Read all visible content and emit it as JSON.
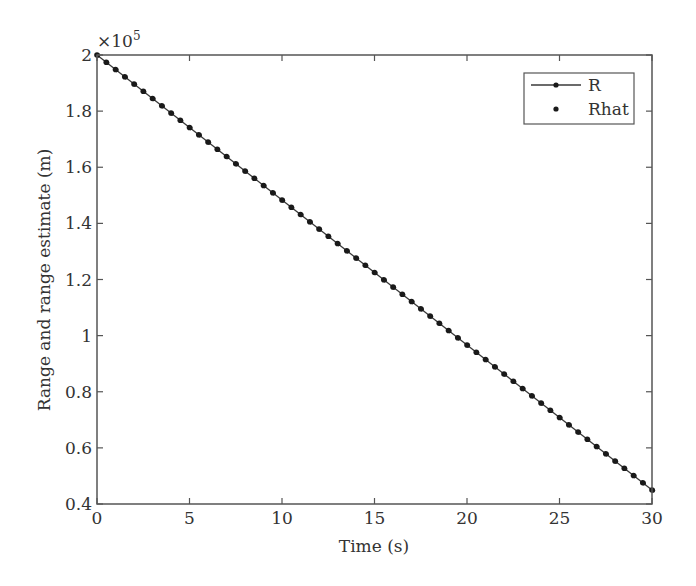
{
  "chart_data": {
    "type": "line",
    "title": "",
    "xlabel": "Time (s)",
    "ylabel": "Range and range estimate (m)",
    "y_multiplier": "×10",
    "y_multiplier_exp": "5",
    "xlim": [
      0,
      30
    ],
    "ylim": [
      0.4,
      2.0
    ],
    "xticks": [
      "0",
      "5",
      "10",
      "15",
      "20",
      "25",
      "30"
    ],
    "yticks": [
      "0.4",
      "0.6",
      "0.8",
      "1",
      "1.2",
      "1.4",
      "1.6",
      "1.8",
      "2"
    ],
    "grid": false,
    "legend_position": "upper right",
    "series": [
      {
        "name": "R",
        "style": "line with dot markers",
        "x_start": 0,
        "x_end": 30,
        "x_step": 0.5,
        "y_start": 2.0,
        "y_end": 0.45
      },
      {
        "name": "Rhat",
        "style": "dot markers",
        "x_start": 0,
        "x_end": 30,
        "x_step": 0.5,
        "y_start": 2.0,
        "y_end": 0.45
      }
    ],
    "x": [
      0,
      0.5,
      1,
      1.5,
      2,
      2.5,
      3,
      3.5,
      4,
      4.5,
      5,
      5.5,
      6,
      6.5,
      7,
      7.5,
      8,
      8.5,
      9,
      9.5,
      10,
      10.5,
      11,
      11.5,
      12,
      12.5,
      13,
      13.5,
      14,
      14.5,
      15,
      15.5,
      16,
      16.5,
      17,
      17.5,
      18,
      18.5,
      19,
      19.5,
      20,
      20.5,
      21,
      21.5,
      22,
      22.5,
      23,
      23.5,
      24,
      24.5,
      25,
      25.5,
      26,
      26.5,
      27,
      27.5,
      28,
      28.5,
      29,
      29.5,
      30
    ],
    "values_note": "y in units of 1e5 m, linear decrease from 2.0 at t=0 to 0.45 at t=30"
  },
  "legend": {
    "items": [
      {
        "label": "R"
      },
      {
        "label": "Rhat"
      }
    ]
  },
  "colors": {
    "line": "#3a3a3a",
    "marker": "#1a1a1a",
    "axis": "#555555"
  }
}
